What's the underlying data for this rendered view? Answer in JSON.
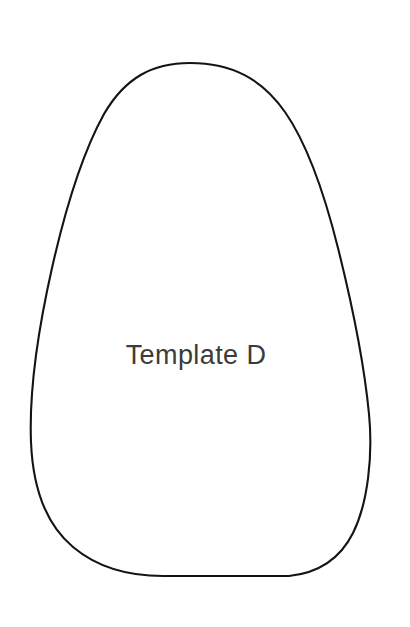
{
  "page": {
    "title": "Template D",
    "background_color": "#ffffff",
    "width": 410,
    "height": 627
  },
  "shape": {
    "name": "template-outline",
    "description": "egg / teardrop outline",
    "stroke_color": "#141414",
    "fill_color": "#ffffff",
    "stroke_width": 2.1,
    "apex": {
      "x": 190,
      "y": 63
    },
    "leftmost": {
      "x": 31,
      "y": 434
    },
    "rightmost": {
      "x": 369,
      "y": 420
    },
    "bottom": {
      "x": 225,
      "y": 576
    }
  },
  "label": {
    "text": "Template D",
    "color": "#3c3c3c",
    "font_size": 27,
    "x": 196,
    "y": 364
  }
}
